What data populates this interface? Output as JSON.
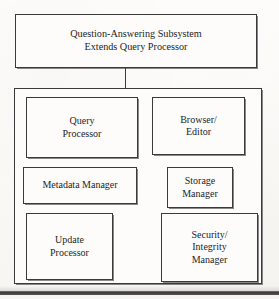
{
  "figure": {
    "title": "Question-Answering Subsystem Extends Query Processor",
    "header": {
      "line1": "Question-Answering Subsystem",
      "line2": "Extends Query Processor"
    },
    "connector_label": "connects header to subsystem container",
    "components": [
      {
        "id": "query-processor",
        "line1": "Query",
        "line2": "Processor"
      },
      {
        "id": "browser-editor",
        "line1": "Browser/",
        "line2": "Editor"
      },
      {
        "id": "metadata-manager",
        "line1": "Metadata Manager",
        "line2": ""
      },
      {
        "id": "storage-manager",
        "line1": "Storage",
        "line2": "Manager"
      },
      {
        "id": "update-processor",
        "line1": "Update",
        "line2": "Processor"
      },
      {
        "id": "security-integrity-manager",
        "line1": "Security/",
        "line2": "Integrity",
        "line3": "Manager"
      }
    ],
    "colors": {
      "ink": "#242427",
      "stroke": "#3a3a3c",
      "paper": "#fcfbf9",
      "box_fill": "#fdfcfb"
    }
  }
}
